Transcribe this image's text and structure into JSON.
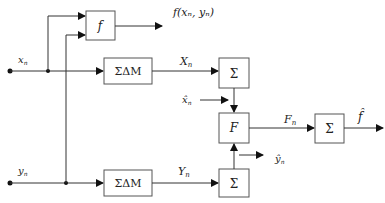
{
  "diagram": {
    "inputs": {
      "x": {
        "label": "x",
        "sub": "n"
      },
      "y": {
        "label": "y",
        "sub": "n"
      }
    },
    "blocks": {
      "f": {
        "label": "f"
      },
      "sdm_top": {
        "label": "ΣΔM"
      },
      "sdm_bottom": {
        "label": "ΣΔM"
      },
      "sum_top": {
        "label": "Σ"
      },
      "F": {
        "label": "F"
      },
      "sum_bottom": {
        "label": "Σ"
      },
      "sum_out": {
        "label": "Σ"
      }
    },
    "signals": {
      "f_out": "f(xₙ, yₙ)",
      "X": {
        "label": "X",
        "sub": "n"
      },
      "Y": {
        "label": "Y",
        "sub": "n"
      },
      "x_hat": {
        "label": "x̂",
        "sub": "n"
      },
      "y_hat": {
        "label": "ŷ",
        "sub": "n"
      },
      "F": {
        "label": "F",
        "sub": "n"
      },
      "f_hat": "f̂"
    }
  }
}
